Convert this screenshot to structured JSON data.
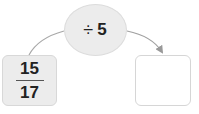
{
  "operation": {
    "symbol": "÷",
    "operand": "5",
    "label": "÷ 5"
  },
  "input": {
    "numerator": "15",
    "denominator": "17"
  },
  "output": {
    "value": ""
  },
  "colors": {
    "bubble_fill": "#ececec",
    "input_fill": "#ececec",
    "output_fill": "#ffffff",
    "arrow": "#999999",
    "text": "#222222"
  }
}
